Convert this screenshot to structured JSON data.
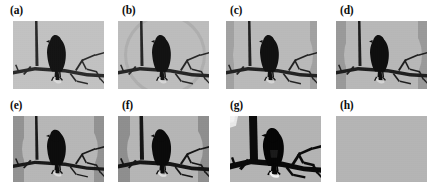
{
  "figure": {
    "caption_style": "lettered-panels",
    "panel_count": 8,
    "background_color": "#ffffff",
    "scene_description": "bird perched on a bare branch against a plain sky",
    "panels": [
      {
        "label": "(a)",
        "row": 0,
        "col": 0,
        "kind": "image",
        "state": "original",
        "sky_color": "#c2c2c2",
        "branch_color": "#2a2a2a",
        "bird_color": "#141414",
        "vignette_color": "#8e8e8e",
        "vignette_opacity": 0.0,
        "contrast": 1.0,
        "blank": false
      },
      {
        "label": "(b)",
        "row": 0,
        "col": 1,
        "kind": "image",
        "state": "degraded-1",
        "sky_color": "#bdbdbd",
        "branch_color": "#262626",
        "bird_color": "#121212",
        "vignette_color": "#8e8e8e",
        "vignette_opacity": 0.3,
        "contrast": 1.1,
        "blank": false
      },
      {
        "label": "(c)",
        "row": 0,
        "col": 2,
        "kind": "image",
        "state": "degraded-2",
        "sky_color": "#bababa",
        "branch_color": "#222222",
        "bird_color": "#101010",
        "vignette_color": "#8a8a8a",
        "vignette_opacity": 0.45,
        "contrast": 1.2,
        "blank": false
      },
      {
        "label": "(d)",
        "row": 0,
        "col": 3,
        "kind": "image",
        "state": "degraded-3",
        "sky_color": "#b8b8b8",
        "branch_color": "#1e1e1e",
        "bird_color": "#0e0e0e",
        "vignette_color": "#868686",
        "vignette_opacity": 0.55,
        "contrast": 1.3,
        "blank": false
      },
      {
        "label": "(e)",
        "row": 1,
        "col": 0,
        "kind": "image",
        "state": "degraded-4",
        "sky_color": "#b7b7b7",
        "branch_color": "#1a1a1a",
        "bird_color": "#0c0c0c",
        "vignette_color": "#828282",
        "vignette_opacity": 0.62,
        "contrast": 1.45,
        "blank": false
      },
      {
        "label": "(f)",
        "row": 1,
        "col": 1,
        "kind": "image",
        "state": "degraded-5",
        "sky_color": "#b6b6b6",
        "branch_color": "#151515",
        "bird_color": "#0a0a0a",
        "vignette_color": "#7e7e7e",
        "vignette_opacity": 0.68,
        "contrast": 1.6,
        "blank": false
      },
      {
        "label": "(g)",
        "row": 1,
        "col": 2,
        "kind": "image",
        "state": "posterized",
        "sky_color": "#b4b4b4",
        "branch_color": "#0a0a0a",
        "bird_color": "#050505",
        "vignette_color": "#7a7a7a",
        "vignette_opacity": 0.2,
        "contrast": 2.4,
        "blank": false
      },
      {
        "label": "(h)",
        "row": 1,
        "col": 3,
        "kind": "blank",
        "state": "blank",
        "sky_color": "#b5b5b5",
        "branch_color": "#b5b5b5",
        "bird_color": "#b5b5b5",
        "vignette_color": "#b5b5b5",
        "vignette_opacity": 0.0,
        "contrast": 0.0,
        "blank": true
      }
    ]
  }
}
